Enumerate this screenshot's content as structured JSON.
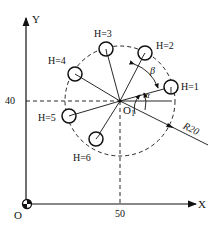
{
  "diagram": {
    "axes": {
      "x_label": "X",
      "y_label": "Y",
      "origin_label": "O",
      "x_tick": "50",
      "y_tick": "40"
    },
    "center": {
      "label": "O",
      "subscript": "1",
      "x": 50,
      "y": 40
    },
    "bolt_circle_radius_label": "R20",
    "angles": {
      "alpha": "α",
      "beta": "β"
    },
    "holes": [
      {
        "label": "H=1"
      },
      {
        "label": "H=2"
      },
      {
        "label": "H=3"
      },
      {
        "label": "H=4"
      },
      {
        "label": "H=5"
      },
      {
        "label": "H=6"
      }
    ]
  }
}
